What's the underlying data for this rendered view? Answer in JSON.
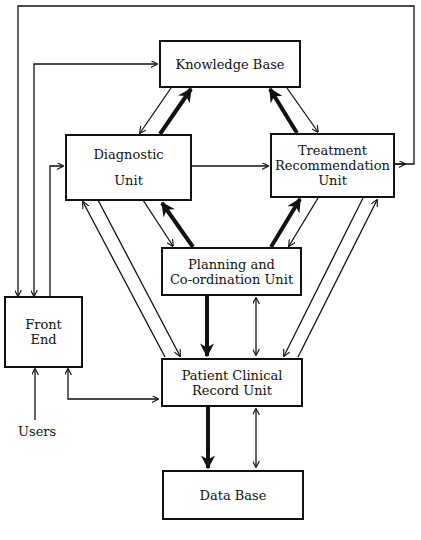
{
  "diagram": {
    "type": "block-diagram",
    "nodes": {
      "knowledge_base": {
        "label": "Knowledge Base"
      },
      "diagnostic": {
        "line1": "Diagnostic",
        "line2": "Unit"
      },
      "treatment": {
        "line1": "Treatment",
        "line2": "Recommendation",
        "line3": "Unit"
      },
      "planning": {
        "line1": "Planning and",
        "line2": "Co-ordination Unit"
      },
      "front_end": {
        "line1": "Front",
        "line2": "End"
      },
      "patient": {
        "line1": "Patient Clinical",
        "line2": "Record Unit"
      },
      "data_base": {
        "label": "Data Base"
      }
    },
    "external_labels": {
      "users": "Users"
    },
    "edges": [
      {
        "from": "Diagnostic Unit",
        "to": "Knowledge Base",
        "style": "thick"
      },
      {
        "from": "Knowledge Base",
        "to": "Diagnostic Unit",
        "style": "thin"
      },
      {
        "from": "Treatment Recommendation Unit",
        "to": "Knowledge Base",
        "style": "thick"
      },
      {
        "from": "Knowledge Base",
        "to": "Treatment Recommendation Unit",
        "style": "thin"
      },
      {
        "from": "Diagnostic Unit",
        "to": "Treatment Recommendation Unit",
        "style": "thin"
      },
      {
        "from": "Planning and Co-ordination Unit",
        "to": "Diagnostic Unit",
        "style": "thick"
      },
      {
        "from": "Diagnostic Unit",
        "to": "Planning and Co-ordination Unit",
        "style": "thin"
      },
      {
        "from": "Planning and Co-ordination Unit",
        "to": "Treatment Recommendation Unit",
        "style": "thick"
      },
      {
        "from": "Treatment Recommendation Unit",
        "to": "Planning and Co-ordination Unit",
        "style": "thin"
      },
      {
        "from": "Planning and Co-ordination Unit",
        "to": "Patient Clinical Record Unit",
        "style": "thick"
      },
      {
        "between": [
          "Planning and Co-ordination Unit",
          "Patient Clinical Record Unit"
        ],
        "style": "thin-bidirectional"
      },
      {
        "from": "Diagnostic Unit",
        "to": "Patient Clinical Record Unit",
        "style": "thin"
      },
      {
        "from": "Patient Clinical Record Unit",
        "to": "Diagnostic Unit",
        "style": "thin"
      },
      {
        "from": "Treatment Recommendation Unit",
        "to": "Patient Clinical Record Unit",
        "style": "thin"
      },
      {
        "from": "Patient Clinical Record Unit",
        "to": "Treatment Recommendation Unit",
        "style": "thin"
      },
      {
        "from": "Patient Clinical Record Unit",
        "to": "Data Base",
        "style": "thick"
      },
      {
        "between": [
          "Patient Clinical Record Unit",
          "Data Base"
        ],
        "style": "thin-bidirectional"
      },
      {
        "between": [
          "Front End",
          "Knowledge Base"
        ],
        "style": "thin-bidirectional"
      },
      {
        "from": "Front End",
        "to": "Diagnostic Unit",
        "style": "thin"
      },
      {
        "from": "Treatment Recommendation Unit",
        "to": "Front End",
        "style": "thin"
      },
      {
        "between": [
          "Front End",
          "Patient Clinical Record Unit"
        ],
        "style": "thin-bidirectional"
      },
      {
        "from": "Users",
        "to": "Front End",
        "style": "thin"
      }
    ]
  }
}
